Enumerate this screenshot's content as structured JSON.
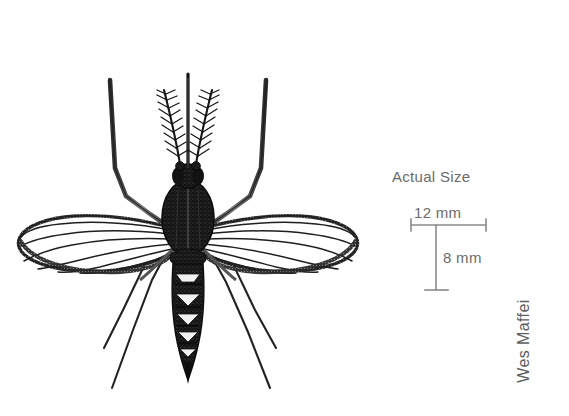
{
  "page": {
    "background_color": "#ffffff",
    "width": 569,
    "height": 416
  },
  "illustration": {
    "subject": "mosquito",
    "description": "Black and white scientific line illustration of a mosquito, dorsal view, with feathery plumose antennae, long proboscis, banded abdomen with pale chevron markings, two veined wings and six long legs.",
    "ink_color": "#1a1a1a"
  },
  "scale": {
    "title": "Actual Size",
    "horizontal_label": "12 mm",
    "vertical_label": "8 mm",
    "rule_color": "#8a8a8a",
    "text_color": "#6b6b6b"
  },
  "credit": {
    "artist": "Wes Maffei",
    "text_color": "#5e5e5e",
    "rotation": "-90deg"
  }
}
